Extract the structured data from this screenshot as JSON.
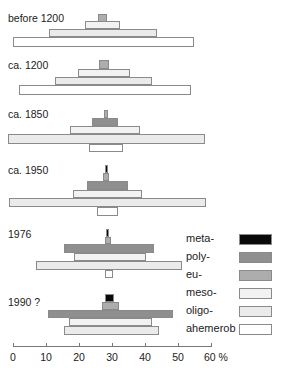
{
  "chart_data": {
    "type": "bar",
    "subtype": "stacked-pyramid (hemeroby levels, centered horizontal bars)",
    "title": "",
    "xlabel": "%",
    "ylabel": "",
    "xlim": [
      0,
      60
    ],
    "x_ticks": [
      "0",
      "10",
      "20",
      "30",
      "40",
      "50",
      "60 %"
    ],
    "legend": [
      {
        "name": "meta-",
        "color": "#0a0a0a"
      },
      {
        "name": "poly-",
        "color": "#8f8f8f"
      },
      {
        "name": "eu-",
        "color": "#adadad"
      },
      {
        "name": "meso-",
        "color": "#f2f2f2"
      },
      {
        "name": "oligo-",
        "color": "#ebebeb"
      },
      {
        "name": "ahemerob",
        "color": "#ffffff"
      }
    ],
    "legend_position": "right",
    "groups": [
      {
        "label": "before 1200",
        "bars": [
          {
            "class": "eu-",
            "start": 25.8,
            "end": 28.5,
            "share": 3
          },
          {
            "class": "meso-",
            "start": 21.8,
            "end": 32.4,
            "share": 11
          },
          {
            "class": "oligo-",
            "start": 10.9,
            "end": 43.6,
            "share": 33
          },
          {
            "class": "ahemerob",
            "start": 0,
            "end": 54.8,
            "share": 55
          }
        ]
      },
      {
        "label": "ca. 1200",
        "bars": [
          {
            "class": "eu-",
            "start": 26.1,
            "end": 29.1,
            "share": 3
          },
          {
            "class": "meso-",
            "start": 19.7,
            "end": 35.5,
            "share": 16
          },
          {
            "class": "oligo-",
            "start": 12.7,
            "end": 42.1,
            "share": 29
          },
          {
            "class": "ahemerob",
            "start": 1.8,
            "end": 53.9,
            "share": 52
          }
        ]
      },
      {
        "label": "ca. 1850",
        "bars": [
          {
            "class": "eu-",
            "start": 27.6,
            "end": 28.8,
            "share": 1
          },
          {
            "class": "poly-",
            "start": 23.9,
            "end": 31.8,
            "share": 8
          },
          {
            "class": "meso-",
            "start": 17.3,
            "end": 38.5,
            "share": 21
          },
          {
            "class": "oligo-",
            "start": -1.5,
            "end": 58.2,
            "share": 60
          },
          {
            "class": "ahemerob",
            "start": 23.0,
            "end": 33.3,
            "share": 10
          }
        ]
      },
      {
        "label": "ca. 1950",
        "bars": [
          {
            "class": "meta-",
            "start": 27.9,
            "end": 28.8,
            "share": 1
          },
          {
            "class": "eu-",
            "start": 27.3,
            "end": 29.1,
            "share": 2
          },
          {
            "class": "poly-",
            "start": 22.4,
            "end": 34.8,
            "share": 12
          },
          {
            "class": "meso-",
            "start": 18.2,
            "end": 39.1,
            "share": 21
          },
          {
            "class": "oligo-",
            "start": -1.2,
            "end": 58.5,
            "share": 60
          },
          {
            "class": "ahemerob",
            "start": 25.5,
            "end": 31.8,
            "share": 6
          }
        ]
      },
      {
        "label": "1976",
        "bars": [
          {
            "class": "meta-",
            "start": 28.2,
            "end": 29.1,
            "share": 1
          },
          {
            "class": "eu-",
            "start": 27.9,
            "end": 29.7,
            "share": 2
          },
          {
            "class": "poly-",
            "start": 15.5,
            "end": 42.7,
            "share": 27
          },
          {
            "class": "meso-",
            "start": 18.5,
            "end": 40.3,
            "share": 22
          },
          {
            "class": "oligo-",
            "start": 7.0,
            "end": 51.2,
            "share": 44
          },
          {
            "class": "ahemerob",
            "start": 27.9,
            "end": 30.3,
            "share": 2
          }
        ]
      },
      {
        "label": "1990 ?",
        "bars": [
          {
            "class": "meta-",
            "start": 27.9,
            "end": 30.6,
            "share": 3
          },
          {
            "class": "eu-",
            "start": 27.0,
            "end": 32.1,
            "share": 5
          },
          {
            "class": "poly-",
            "start": 10.6,
            "end": 48.5,
            "share": 38
          },
          {
            "class": "meso-",
            "start": 17.0,
            "end": 42.1,
            "share": 25
          },
          {
            "class": "oligo-",
            "start": 15.5,
            "end": 44.2,
            "share": 29
          }
        ]
      }
    ]
  },
  "layout_hint": {
    "axis_origin_px": 13,
    "px_per_percent": 3.3,
    "group_rows_px": [
      {
        "label_y": 13,
        "bars_y": [
          14,
          21,
          29,
          37
        ],
        "bars_h": [
          8,
          8,
          8,
          10
        ]
      },
      {
        "label_y": 60,
        "bars_y": [
          60,
          69,
          77,
          85
        ],
        "bars_h": [
          9,
          8,
          8,
          10
        ]
      },
      {
        "label_y": 109,
        "bars_y": [
          110,
          118,
          126,
          134,
          144
        ],
        "bars_h": [
          8,
          8,
          8,
          10,
          8
        ]
      },
      {
        "label_y": 165,
        "bars_y": [
          165,
          173,
          181,
          190,
          198,
          207
        ],
        "bars_h": [
          8,
          8,
          9,
          8,
          9,
          9
        ]
      },
      {
        "label_y": 229,
        "bars_y": [
          229,
          237,
          244,
          253,
          261,
          270
        ],
        "bars_h": [
          8,
          7,
          9,
          8,
          9,
          8
        ]
      },
      {
        "label_y": 297,
        "bars_y": [
          294,
          302,
          310,
          318,
          326
        ],
        "bars_h": [
          8,
          8,
          8,
          8,
          9
        ]
      }
    ],
    "legend_rows_y": [
      229,
      247,
      265,
      283,
      301,
      319
    ]
  }
}
